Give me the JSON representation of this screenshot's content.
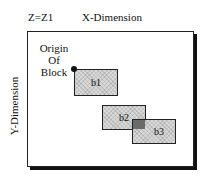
{
  "diagram": {
    "z_label": "Z=Z1",
    "x_axis_label": "X-Dimension",
    "y_axis_label": "Y-Dimension",
    "origin_label": [
      "Origin",
      "Of",
      "Block"
    ],
    "blocks": [
      {
        "id": "b1",
        "label": "b1"
      },
      {
        "id": "b2",
        "label": "b2"
      },
      {
        "id": "b3",
        "label": "b3"
      }
    ],
    "colors": {
      "block_fill": "#d8d8d8",
      "overlap_fill": "#6a6a6a",
      "frame_border": "#222222"
    }
  }
}
